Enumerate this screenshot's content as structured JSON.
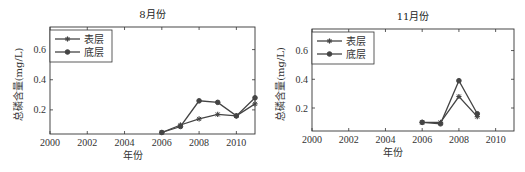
{
  "chart_data": [
    {
      "type": "line",
      "title": "8月份",
      "xlabel": "年份",
      "ylabel": "总磷含量(mg/L)",
      "xlim": [
        2000,
        2011
      ],
      "ylim": [
        0.04,
        0.75
      ],
      "xticks": [
        2000,
        2002,
        2004,
        2006,
        2008,
        2010
      ],
      "xtick_labels": [
        "2000",
        "2002",
        "2004",
        "2006",
        "2008",
        "2010"
      ],
      "yticks": [
        0.2,
        0.4,
        0.6
      ],
      "ytick_labels": [
        "0.2",
        "0.4",
        "0.6"
      ],
      "legend_position": "top-left",
      "series": [
        {
          "name": "表层",
          "marker": "star",
          "x": [
            2006,
            2007,
            2008,
            2009,
            2010,
            2011
          ],
          "values": [
            0.05,
            0.1,
            0.14,
            0.17,
            0.16,
            0.24
          ]
        },
        {
          "name": "底层",
          "marker": "dot",
          "x": [
            2006,
            2007,
            2008,
            2009,
            2010,
            2011
          ],
          "values": [
            0.05,
            0.09,
            0.26,
            0.25,
            0.16,
            0.28
          ]
        }
      ]
    },
    {
      "type": "line",
      "title": "11月份",
      "xlabel": "年份",
      "ylabel": "总磷含量(mg/L)",
      "xlim": [
        2000,
        2011
      ],
      "ylim": [
        0.04,
        0.75
      ],
      "xticks": [
        2000,
        2002,
        2004,
        2006,
        2008,
        2010
      ],
      "xtick_labels": [
        "2000",
        "2002",
        "2004",
        "2006",
        "2008",
        "2010"
      ],
      "yticks": [
        0.2,
        0.4,
        0.6
      ],
      "ytick_labels": [
        "0.2",
        "0.4",
        "0.6"
      ],
      "legend_position": "top-left",
      "series": [
        {
          "name": "表层",
          "marker": "star",
          "x": [
            2006,
            2007,
            2008,
            2009
          ],
          "values": [
            0.1,
            0.1,
            0.28,
            0.14
          ]
        },
        {
          "name": "底层",
          "marker": "dot",
          "x": [
            2006,
            2007,
            2008,
            2009
          ],
          "values": [
            0.1,
            0.09,
            0.39,
            0.16
          ]
        }
      ]
    }
  ]
}
